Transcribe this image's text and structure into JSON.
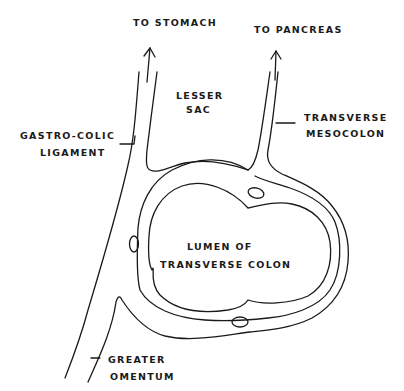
{
  "diagram": {
    "labels": {
      "to_stomach": "TO STOMACH",
      "to_pancreas": "TO PANCREAS",
      "lesser_sac_1": "LESSER",
      "lesser_sac_2": "SAC",
      "gastro_colic_1": "GASTRO-COLIC",
      "gastro_colic_2": "LIGAMENT",
      "transverse_mesocolon_1": "TRANSVERSE",
      "transverse_mesocolon_2": "MESOCOLON",
      "lumen_1": "LUMEN OF",
      "lumen_2": "TRANSVERSE COLON",
      "greater_omentum_1": "GREATER",
      "greater_omentum_2": "OMENTUM"
    },
    "colors": {
      "ink": "#1a1a1a",
      "background": "#ffffff"
    }
  }
}
